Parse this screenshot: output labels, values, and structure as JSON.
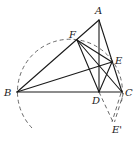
{
  "diagram": {
    "type": "geometry-figure",
    "points": {
      "A": {
        "label": "A",
        "x": 99,
        "y": 20,
        "lx": 95,
        "ly": 14
      },
      "B": {
        "label": "B",
        "x": 17,
        "y": 92,
        "lx": 5,
        "ly": 96
      },
      "C": {
        "label": "C",
        "x": 122,
        "y": 92,
        "lx": 125,
        "ly": 96
      },
      "D": {
        "label": "D",
        "x": 99,
        "y": 92,
        "lx": 92,
        "ly": 104
      },
      "E": {
        "label": "E",
        "x": 112,
        "y": 62,
        "lx": 115,
        "ly": 63
      },
      "F": {
        "label": "F",
        "x": 77,
        "y": 40,
        "lx": 69,
        "ly": 37
      },
      "E_prime": {
        "label": "E'",
        "x": 113,
        "y": 122,
        "lx": 114,
        "ly": 133
      }
    },
    "solid_segments": [
      [
        "A",
        "B"
      ],
      [
        "A",
        "C"
      ],
      [
        "A",
        "D"
      ],
      [
        "B",
        "C"
      ],
      [
        "B",
        "E"
      ],
      [
        "F",
        "E"
      ],
      [
        "F",
        "C"
      ],
      [
        "F",
        "D"
      ],
      [
        "D",
        "E"
      ]
    ],
    "dashed_segments": [
      [
        "D",
        "E_prime"
      ]
    ],
    "double_dashed_segments": [
      [
        "C",
        "E_prime"
      ]
    ],
    "circle_arc": {
      "center_x": 69.5,
      "center_y": 92,
      "radius": 52.5,
      "style": "dashed"
    }
  }
}
